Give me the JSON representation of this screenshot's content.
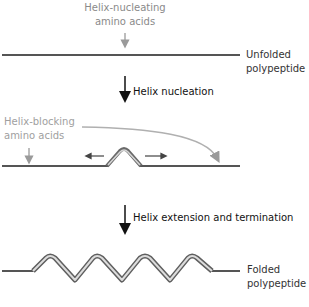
{
  "diagram": {
    "title": "",
    "top_annotation": {
      "line1": "Helix-nucleating",
      "line2": "amino acids",
      "color": "#8a8a8a"
    },
    "stage_unfolded": {
      "label_line1": "Unfolded",
      "label_line2": "polypeptide"
    },
    "step1": {
      "label": "Helix nucleation"
    },
    "blocking_annotation": {
      "line1": "Helix-blocking",
      "line2": "amino acids",
      "color": "#a0a0a0"
    },
    "step2": {
      "label": "Helix extension and termination"
    },
    "stage_folded": {
      "label_line1": "Folded",
      "label_line2": "polypeptide"
    },
    "colors": {
      "line": "#555555",
      "arrow_black": "#111111",
      "arrow_gray": "#9a9a9a",
      "helix_light": "#d8d8d8",
      "helix_dark": "#6a6a6a"
    }
  }
}
